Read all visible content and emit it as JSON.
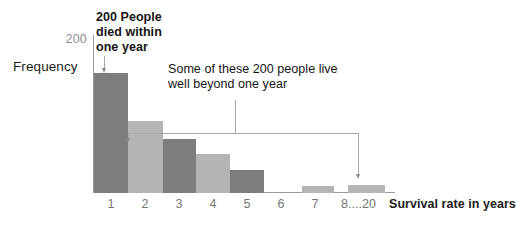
{
  "chart_data": {
    "type": "bar",
    "title": "",
    "xlabel": "Survival rate in years",
    "ylabel": "Frequency",
    "ylim": [
      0,
      200
    ],
    "y_axis_max_label": "200",
    "grid": false,
    "legend": "none",
    "categories": [
      "1",
      "2",
      "3",
      "4",
      "5",
      "6",
      "7",
      "8......",
      "20"
    ],
    "tick_labels": [
      "1",
      "2",
      "3",
      "4",
      "5",
      "6",
      "7",
      "8......",
      "20"
    ],
    "values": [
      200,
      120,
      90,
      65,
      38,
      0,
      12,
      0,
      14
    ],
    "bar_colors": [
      "#7d7d7d",
      "#b4b4b4",
      "#7d7d7d",
      "#b4b4b4",
      "#7d7d7d",
      "#b4b4b4",
      "#b4b4b4",
      "#b4b4b4",
      "#b4b4b4"
    ],
    "annotations": [
      {
        "id": "died-within-one-year",
        "text": "200 People\ndied within\none year",
        "points_to_category": "1"
      },
      {
        "id": "live-beyond-one-year",
        "text": "Some of these 200 people live\nwell beyond one year",
        "points_to_categories": [
          "2",
          "20"
        ]
      }
    ]
  },
  "colors": {
    "bar_dark": "#7d7d7d",
    "bar_light": "#b4b4b4",
    "axis": "#9a9a9a",
    "leader_line": "#a8a8a8",
    "tick_text": "#767676",
    "y_max_text": "#8d8d8d",
    "body_text": "#141414",
    "background": "#ffffff"
  }
}
